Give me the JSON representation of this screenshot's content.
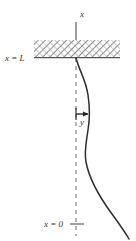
{
  "figure": {
    "background_color": "#ffffff",
    "width": 136,
    "height": 241,
    "labels": {
      "axis_top": "x",
      "wall_label": "x = L",
      "deflection_label": "y",
      "base_label": "x = 0"
    },
    "colors": {
      "curve": "#2e2e2e",
      "axis": "#6b6b6b",
      "hatch": "#6e6e6e",
      "text": "#333333",
      "arrow": "#1f1f1f"
    },
    "elements": {
      "axis_solid": {
        "name": "x-axis-solid-segment",
        "x": 76,
        "y_top": 22,
        "y_bottom": 58
      },
      "axis_dashed": {
        "name": "x-axis-dashed-segment",
        "x": 76,
        "y_top": 58,
        "y_bottom": 236,
        "dash": "4 4"
      },
      "hatch_band": {
        "name": "fixed-support-hatch",
        "x": 34,
        "y": 40,
        "width": 86,
        "height": 17
      },
      "wall_line": {
        "name": "support-baseline",
        "x1": 34,
        "x2": 120,
        "y": 58
      },
      "deflection_arrow": {
        "name": "deflection-arrow",
        "x1": 76,
        "x2": 91,
        "y": 114
      },
      "base_tick": {
        "name": "origin-tick",
        "x1": 70,
        "x2": 84,
        "y": 224
      },
      "curve": {
        "name": "deflected-beam-curve",
        "path": "M 76,58 C 79,70 86,80 88,95 C 90,108 90,118 88,130 C 86,144 84,152 86,162 C 89,178 98,195 112,214 C 120,225 125,232 129,239"
      }
    },
    "label_positions": {
      "axis_top": {
        "x": 80,
        "y": 17
      },
      "wall_label": {
        "x": 5,
        "y": 58
      },
      "deflection_label": {
        "x": 80,
        "y": 124
      },
      "base_label": {
        "x": 44,
        "y": 228
      }
    }
  }
}
